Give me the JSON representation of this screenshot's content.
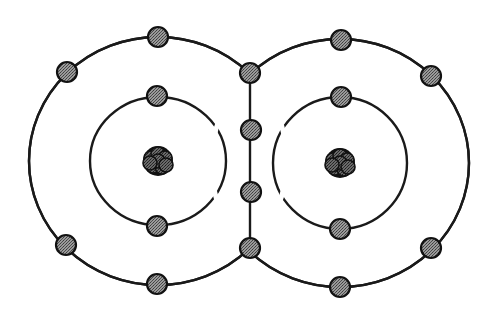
{
  "diagram": {
    "title": "Covalent bond Bohr diagram of a diatomic molecule (O2 style) with two shared electron pairs",
    "colors": {
      "background": "#ffffff",
      "line": "#1a1a1a",
      "electron_fill": "#8a8a8a",
      "electron_stroke": "#111111",
      "nucleus_fill": "#555555",
      "nucleus_stroke": "#111111"
    },
    "atoms": [
      {
        "id": "left-atom",
        "center": [
          158,
          161
        ],
        "inner_shell": {
          "rx": 68,
          "ry": 64
        },
        "outer_shell": {
          "rx": 129,
          "ry": 124
        },
        "inner_electrons": [
          [
            157,
            96
          ],
          [
            157,
            226
          ]
        ],
        "outer_electrons": [
          [
            158,
            37
          ],
          [
            67,
            72
          ],
          [
            66,
            245
          ],
          [
            157,
            284
          ]
        ]
      },
      {
        "id": "right-atom",
        "center": [
          340,
          163
        ],
        "inner_shell": {
          "rx": 67,
          "ry": 66
        },
        "outer_shell": {
          "rx": 129,
          "ry": 124
        },
        "inner_electrons": [
          [
            341,
            97
          ],
          [
            340,
            229
          ]
        ],
        "outer_electrons": [
          [
            341,
            40
          ],
          [
            431,
            76
          ],
          [
            431,
            248
          ],
          [
            340,
            287
          ]
        ]
      }
    ],
    "shared_bond": {
      "line_x": 250,
      "line_y": [
        73,
        248
      ],
      "electrons": [
        [
          250,
          73
        ],
        [
          251,
          130
        ],
        [
          251,
          192
        ],
        [
          250,
          248
        ]
      ]
    },
    "electron_radius": 10,
    "nucleus_radius": 15
  }
}
